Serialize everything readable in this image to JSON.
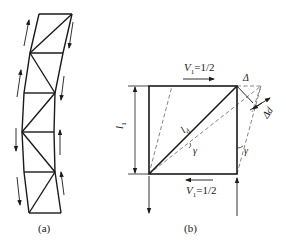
{
  "figure_a": {
    "caption": "(a)",
    "description": "Braced frame (truss column) deformed in shear, with diagonal bracing and shear force arrows along both chords"
  },
  "figure_b": {
    "caption": "(b)",
    "top_force": {
      "symbol": "V",
      "subscript": "1",
      "value": "=1/2"
    },
    "bottom_force": {
      "symbol": "V",
      "subscript": "1",
      "value": "=1/2"
    },
    "height_label": {
      "symbol": "l",
      "subscript": "1"
    },
    "diagonal_label": {
      "symbol": "l",
      "subscript": "d"
    },
    "angle_label_diagonal": "γ",
    "angle_label_side": "γ",
    "displacement_label": "Δ",
    "diagonal_elongation_label": "Δd"
  },
  "colors": {
    "line": "#1a1a1a",
    "dashed": "#666666",
    "background": "#ffffff"
  }
}
